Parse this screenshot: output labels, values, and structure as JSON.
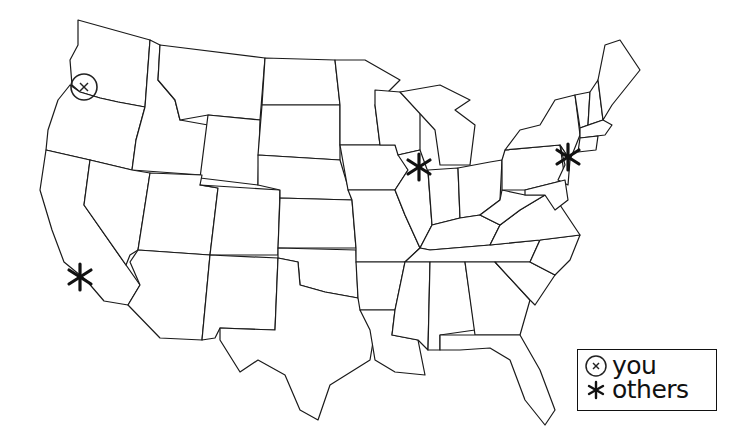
{
  "map": {
    "region": "Contiguous United States",
    "style": "state outlines, black on white",
    "colors": {
      "background": "#ffffff",
      "outline": "#1a1a1a",
      "marker": "#111111"
    }
  },
  "markers": [
    {
      "type": "you",
      "icon": "circled-x-icon",
      "location": "Oregon (northwest)",
      "x": 84,
      "y": 87
    },
    {
      "type": "others",
      "icon": "asterisk-icon",
      "location": "Southern California",
      "x": 80,
      "y": 277
    },
    {
      "type": "others",
      "icon": "asterisk-icon",
      "location": "Chicago area",
      "x": 419,
      "y": 167
    },
    {
      "type": "others",
      "icon": "asterisk-icon",
      "location": "New York area",
      "x": 568,
      "y": 157
    }
  ],
  "legend": {
    "items": [
      {
        "icon": "circled-x-icon",
        "label": "you"
      },
      {
        "icon": "asterisk-icon",
        "label": "others"
      }
    ]
  }
}
